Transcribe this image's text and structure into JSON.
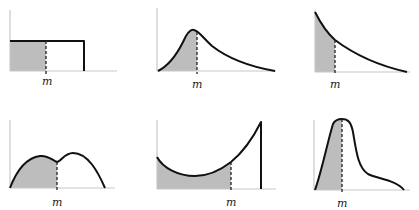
{
  "figure": {
    "shade_color": "#bdbdbd",
    "curve_color": "#111111",
    "axis_color": "#c8c8c8",
    "panels": [
      {
        "id": 1,
        "shape": "uniform",
        "median_label": "m"
      },
      {
        "id": 2,
        "shape": "right-skewed unimodal",
        "median_label": "m"
      },
      {
        "id": 3,
        "shape": "exponential decay",
        "median_label": "m"
      },
      {
        "id": 4,
        "shape": "bimodal",
        "median_label": "m"
      },
      {
        "id": 5,
        "shape": "U-shaped left-skewed",
        "median_label": "m"
      },
      {
        "id": 6,
        "shape": "right-skewed peaked",
        "median_label": "m"
      }
    ]
  }
}
